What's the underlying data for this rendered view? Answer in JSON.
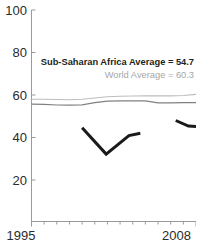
{
  "chart_data": {
    "type": "line",
    "title": "",
    "subtitle": "",
    "xlabel": "",
    "ylabel": "",
    "xlim": [
      1995,
      2008
    ],
    "ylim": [
      0,
      100
    ],
    "yticks": [
      100,
      80,
      60,
      40,
      20
    ],
    "ytick_labels": [
      "100",
      "80",
      "60",
      "40",
      "20"
    ],
    "xticks": [
      1995,
      2008
    ],
    "xtick_labels": [
      "1995",
      "2008"
    ],
    "grid": false,
    "legend_position": "none",
    "annotations": [
      {
        "name": "ssa-average",
        "text": "Sub-Saharan Africa Average = 54.7",
        "value": 54.7,
        "color": "#231f20",
        "bold": true
      },
      {
        "name": "world-average",
        "text": "World Average = 60.3",
        "value": 60.3,
        "color": "#a6a6a6",
        "bold": false
      }
    ],
    "series": [
      {
        "name": "World Average",
        "color": "#bdbdbd",
        "width": 1.1,
        "x": [
          1995,
          1996,
          1997,
          1998,
          1999,
          2000,
          2001,
          2002,
          2003,
          2004,
          2005,
          2006,
          2007,
          2008
        ],
        "values": [
          58.0,
          58.0,
          57.9,
          57.8,
          58.0,
          58.6,
          59.2,
          59.4,
          59.5,
          59.6,
          59.6,
          59.6,
          59.8,
          60.3
        ]
      },
      {
        "name": "Sub-Saharan Africa Average",
        "color": "#808080",
        "width": 1.2,
        "x": [
          1995,
          1996,
          1997,
          1998,
          1999,
          2000,
          2001,
          2002,
          2003,
          2004,
          2005,
          2006,
          2007,
          2008
        ],
        "values": [
          55.7,
          55.6,
          55.3,
          55.2,
          55.4,
          56.4,
          57.1,
          57.2,
          57.3,
          57.2,
          56.3,
          56.3,
          56.4,
          56.4
        ]
      },
      {
        "name": "Country",
        "color": "#1a1a1a",
        "width": 3.0,
        "segments": [
          {
            "x": [
              1999,
              2000.9,
              2002.7,
              2003.6
            ],
            "values": [
              44.6,
              32.2,
              40.9,
              42.0
            ]
          },
          {
            "x": [
              2006.4,
              2007.4,
              2008
            ],
            "values": [
              48.0,
              45.4,
              45.2
            ]
          }
        ]
      }
    ]
  },
  "axes": {
    "y_axis_name": "y-axis",
    "x_axis_name": "x-axis"
  }
}
